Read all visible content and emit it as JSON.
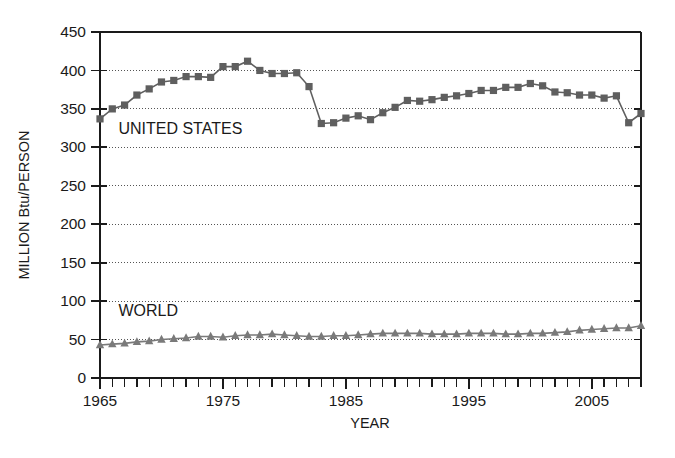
{
  "chart_data": {
    "type": "line",
    "title": "",
    "subtitle": "",
    "xlabel": "YEAR",
    "ylabel": "MILLION Btu/PERSON",
    "xlim": [
      1965,
      2009
    ],
    "ylim": [
      0,
      450
    ],
    "yticks": [
      0,
      50,
      100,
      150,
      200,
      250,
      300,
      350,
      400,
      450
    ],
    "ytick_labels": [
      "0",
      "50",
      "100",
      "150",
      "200",
      "250",
      "300",
      "350",
      "400",
      "450"
    ],
    "xticks_labeled": [
      1965,
      1975,
      1985,
      1995,
      2005
    ],
    "xtick_labels": [
      "1965",
      "1975",
      "1985",
      "1995",
      "2005"
    ],
    "xtick_minor_step": 1,
    "grid": "horizontal-dotted",
    "legend_position": "inline-annotation",
    "x": [
      1965,
      1966,
      1967,
      1968,
      1969,
      1970,
      1971,
      1972,
      1973,
      1974,
      1975,
      1976,
      1977,
      1978,
      1979,
      1980,
      1981,
      1982,
      1983,
      1984,
      1985,
      1986,
      1987,
      1988,
      1989,
      1990,
      1991,
      1992,
      1993,
      1994,
      1995,
      1996,
      1997,
      1998,
      1999,
      2000,
      2001,
      2002,
      2003,
      2004,
      2005,
      2006,
      2007,
      2008,
      2009
    ],
    "series": [
      {
        "name": "UNITED STATES",
        "marker": "square",
        "color": "#5f5f5f",
        "values": [
          337,
          350,
          355,
          368,
          376,
          385,
          387,
          392,
          392,
          391,
          405,
          405,
          412,
          400,
          396,
          396,
          397,
          379,
          331,
          332,
          338,
          341,
          336,
          345,
          352,
          361,
          360,
          362,
          365,
          367,
          370,
          374,
          374,
          378,
          378,
          383,
          380,
          372,
          371,
          368,
          368,
          364,
          367,
          332,
          344
        ],
        "annotation": "UNITED STATES"
      },
      {
        "name": "WORLD",
        "marker": "triangle",
        "color": "#7a7a7a",
        "values": [
          43,
          44,
          45,
          47,
          48,
          50,
          51,
          52,
          54,
          54,
          53,
          55,
          56,
          56,
          57,
          56,
          55,
          54,
          54,
          55,
          55,
          56,
          57,
          58,
          58,
          58,
          58,
          57,
          57,
          57,
          58,
          58,
          58,
          57,
          57,
          58,
          58,
          59,
          60,
          62,
          63,
          64,
          65,
          65,
          68
        ],
        "annotation": "WORLD"
      }
    ],
    "annotations": [
      {
        "text": "UNITED STATES",
        "x": 1966.5,
        "y": 317
      },
      {
        "text": "WORLD",
        "x": 1966.5,
        "y": 81
      }
    ]
  }
}
